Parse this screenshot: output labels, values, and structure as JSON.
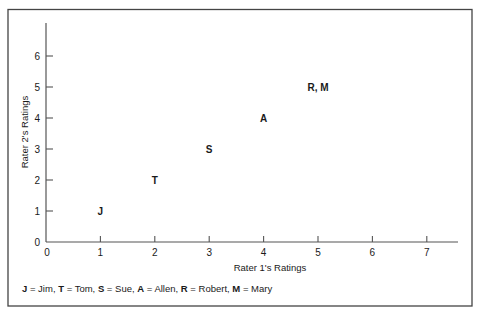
{
  "chart_data": {
    "type": "scatter",
    "title": "",
    "xlabel": "Rater 1's Ratings",
    "ylabel": "Rater 2's Ratings",
    "xlim": [
      0,
      7.5
    ],
    "ylim": [
      0,
      7
    ],
    "x_ticks": [
      0,
      1,
      2,
      3,
      4,
      5,
      6,
      7
    ],
    "y_ticks": [
      0,
      1,
      2,
      3,
      4,
      5,
      6
    ],
    "grid": false,
    "points": [
      {
        "label": "J",
        "x": 1,
        "y": 1
      },
      {
        "label": "T",
        "x": 2,
        "y": 2
      },
      {
        "label": "S",
        "x": 3,
        "y": 3
      },
      {
        "label": "A",
        "x": 4,
        "y": 4
      },
      {
        "label": "R, M",
        "x": 5,
        "y": 5
      }
    ],
    "legend": [
      {
        "key": "J",
        "name": "Jim"
      },
      {
        "key": "T",
        "name": "Tom"
      },
      {
        "key": "S",
        "name": "Sue"
      },
      {
        "key": "A",
        "name": "Allen"
      },
      {
        "key": "R",
        "name": "Robert"
      },
      {
        "key": "M",
        "name": "Mary"
      }
    ],
    "legend_position": "bottom-left"
  },
  "colors": {
    "ink": "#1a1a1a",
    "axis": "#555555",
    "border": "#444444",
    "background": "#ffffff"
  }
}
